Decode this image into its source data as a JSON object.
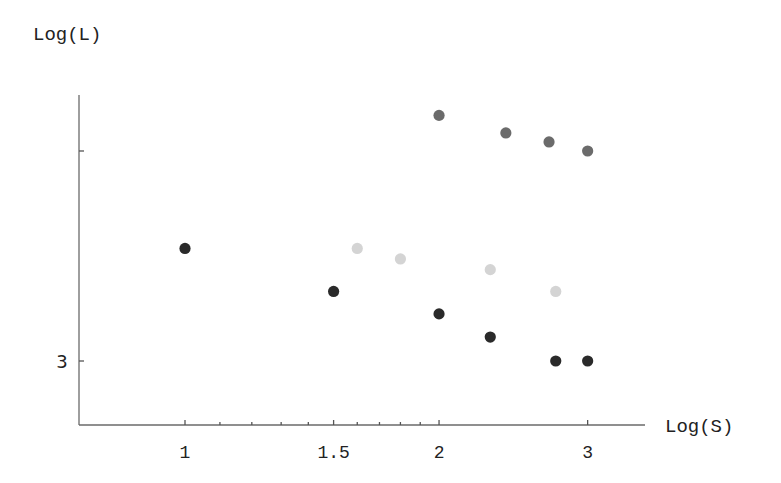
{
  "chart_data": {
    "type": "scatter",
    "title": "",
    "xlabel": "Log(S)",
    "ylabel": "Log(L)",
    "x_scale": "log",
    "y_scale": "log",
    "x_ticks": [
      {
        "value": 1,
        "label": "1"
      },
      {
        "value": 1.5,
        "label": "1.5"
      },
      {
        "value": 2,
        "label": "2"
      },
      {
        "value": 3,
        "label": "3"
      }
    ],
    "x_minor_ticks": [
      1.1,
      1.2,
      1.3,
      1.4,
      1.6,
      1.7,
      1.8,
      1.9
    ],
    "y_ticks": [
      {
        "value": 3,
        "label": "3"
      },
      {
        "value": 4,
        "label": ""
      }
    ],
    "xlim": [
      0.8,
      3.3
    ],
    "ylim": [
      2.75,
      4.5
    ],
    "grid": false,
    "legend": null,
    "series": [
      {
        "name": "medium-gray",
        "color": "#6b6b6b",
        "points": [
          [
            2,
            4.2
          ],
          [
            2.4,
            4.1
          ],
          [
            2.7,
            4.05
          ],
          [
            3,
            4.0
          ]
        ]
      },
      {
        "name": "light-gray",
        "color": "#d4d4d4",
        "points": [
          [
            1.6,
            3.5
          ],
          [
            1.8,
            3.45
          ],
          [
            2.3,
            3.4
          ],
          [
            2.75,
            3.3
          ]
        ]
      },
      {
        "name": "dark",
        "color": "#2a2a2a",
        "points": [
          [
            1,
            3.5
          ],
          [
            1.5,
            3.3
          ],
          [
            2,
            3.2
          ],
          [
            2.3,
            3.1
          ],
          [
            2.75,
            3.0
          ],
          [
            3,
            3.0
          ]
        ]
      }
    ]
  }
}
